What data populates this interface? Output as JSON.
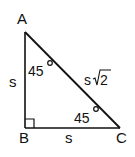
{
  "diagram": {
    "type": "right-triangle",
    "vertices": [
      {
        "name": "A",
        "label": "A"
      },
      {
        "name": "B",
        "label": "B"
      },
      {
        "name": "C",
        "label": "C"
      }
    ],
    "sides": {
      "AB": "s",
      "BC": "s",
      "AC_prefix": "s",
      "AC_radicand": "2"
    },
    "angles": {
      "A": "45",
      "C": "45",
      "B": "right-angle"
    },
    "colors": {
      "stroke": "#111111",
      "background": "#ffffff"
    }
  }
}
